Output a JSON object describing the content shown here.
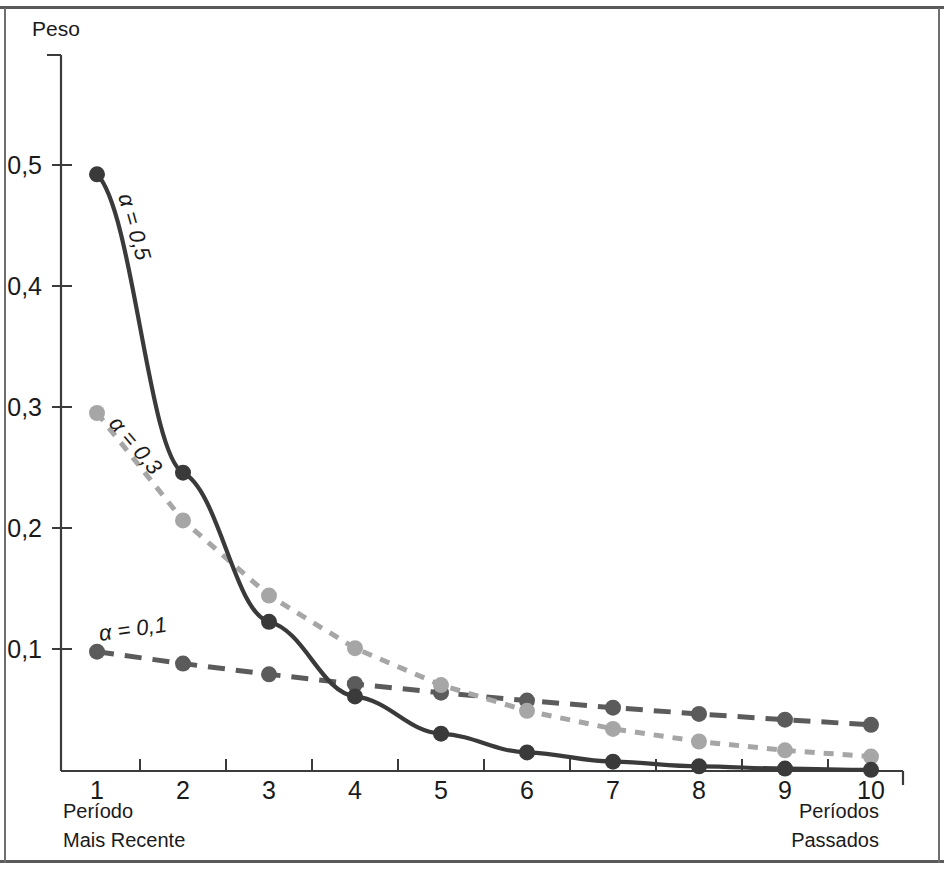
{
  "figure": {
    "background": "#ffffff",
    "rule_color": "#5a5a5a",
    "axis_color": "#3b3b3b"
  },
  "axes": {
    "y_axis_title": "Peso",
    "y_ticks": [
      "0,1",
      "0,2",
      "0,3",
      "0,4",
      "0,5"
    ],
    "y_tick_values": [
      0.1,
      0.2,
      0.3,
      0.4,
      0.5
    ],
    "x_tick_labels": [
      "1",
      "2",
      "3",
      "4",
      "5",
      "6",
      "7",
      "8",
      "9",
      "10"
    ],
    "x_left_caption_line1": "Período",
    "x_left_caption_line2": "Mais Recente",
    "x_right_caption_line1": "Períodos",
    "x_right_caption_line2": "Passados"
  },
  "series_labels": {
    "alpha_05": "α = 0,5",
    "alpha_03": "α = 0,3",
    "alpha_01": "α = 0,1"
  },
  "chart_data": {
    "type": "line",
    "title": "",
    "xlabel": "",
    "ylabel": "Peso",
    "x": [
      1,
      2,
      3,
      4,
      5,
      6,
      7,
      8,
      9,
      10
    ],
    "xlim": [
      0.6,
      10.4
    ],
    "ylim": [
      0,
      0.6
    ],
    "grid": false,
    "legend": "inline-annotations",
    "annotations": [
      "α = 0,5",
      "α = 0,3",
      "α = 0,1"
    ],
    "series": [
      {
        "name": "α = 0,5",
        "alpha": 0.5,
        "color": "#3a3a3a",
        "linestyle": "solid",
        "marker": "circle",
        "values": [
          0.5,
          0.25,
          0.125,
          0.0625,
          0.0313,
          0.0156,
          0.0078,
          0.0039,
          0.002,
          0.001
        ]
      },
      {
        "name": "α = 0,3",
        "alpha": 0.3,
        "color": "#a6a6a6",
        "linestyle": "dashed-short",
        "marker": "circle",
        "values": [
          0.3,
          0.21,
          0.147,
          0.1029,
          0.072,
          0.0504,
          0.0353,
          0.0247,
          0.0173,
          0.0121
        ]
      },
      {
        "name": "α = 0,1",
        "alpha": 0.1,
        "color": "#5b5b5b",
        "linestyle": "dashed-long",
        "marker": "circle",
        "values": [
          0.1,
          0.09,
          0.081,
          0.0729,
          0.0656,
          0.059,
          0.0531,
          0.0478,
          0.043,
          0.0387
        ]
      }
    ]
  }
}
